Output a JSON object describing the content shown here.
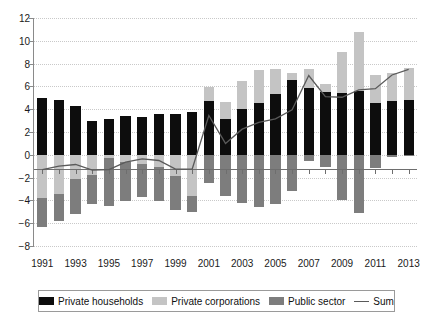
{
  "chart_data": {
    "type": "bar",
    "subtype": "stacked-bar-with-line-overlay",
    "title": "",
    "subtitle": "",
    "xlabel": "",
    "ylabel": "",
    "ylim": [
      -8,
      12
    ],
    "ytick_step": 2,
    "ytick_labels": [
      "12",
      "10",
      "8",
      "6",
      "4",
      "2",
      "0",
      "−2",
      "−4",
      "−6",
      "−8"
    ],
    "ytick_values": [
      12,
      10,
      8,
      6,
      4,
      2,
      0,
      -2,
      -4,
      -6,
      -8
    ],
    "grid": true,
    "grid_style": "dotted-horizontal",
    "legend_position": "bottom",
    "categories": [
      1991,
      1992,
      1993,
      1994,
      1995,
      1996,
      1997,
      1998,
      1999,
      2000,
      2001,
      2002,
      2003,
      2004,
      2005,
      2006,
      2007,
      2008,
      2009,
      2010,
      2011,
      2012,
      2013
    ],
    "xtick_labels": [
      "1991",
      "1993",
      "1995",
      "1997",
      "1999",
      "2001",
      "2003",
      "2005",
      "2007",
      "2009",
      "2011",
      "2013"
    ],
    "xtick_values": [
      1991,
      1993,
      1995,
      1997,
      1999,
      2001,
      2003,
      2005,
      2007,
      2009,
      2011,
      2013
    ],
    "series": [
      {
        "name": "Private households",
        "color": "#0d0d0d",
        "kind": "bar",
        "values": [
          5.0,
          4.85,
          4.3,
          3.0,
          3.15,
          3.4,
          3.35,
          3.55,
          3.55,
          3.75,
          4.75,
          3.1,
          4.0,
          4.55,
          5.3,
          6.6,
          5.9,
          5.5,
          5.45,
          5.6,
          4.55,
          4.75,
          4.85
        ]
      },
      {
        "name": "Private corporations",
        "color": "#c4c4c4",
        "kind": "bar",
        "values": [
          -3.75,
          -3.45,
          -2.1,
          -1.8,
          -0.3,
          -0.6,
          -0.8,
          -1.05,
          -1.9,
          -3.65,
          1.2,
          1.5,
          2.5,
          2.9,
          2.2,
          0.55,
          1.6,
          0.7,
          3.6,
          5.2,
          2.45,
          2.4,
          2.75
        ]
      },
      {
        "name": "Public sector",
        "color": "#7d7d7d",
        "kind": "bar",
        "values": [
          -2.55,
          -2.4,
          -3.05,
          -2.55,
          -4.15,
          -3.45,
          -2.9,
          -3.0,
          -2.9,
          -1.35,
          -2.5,
          -3.6,
          -4.25,
          -4.6,
          -4.35,
          -3.2,
          -0.55,
          -1.1,
          -4.0,
          -5.1,
          -1.2,
          -0.15,
          -0.1
        ]
      }
    ],
    "line_series": {
      "name": "Sum",
      "color": "#5a5a5a",
      "kind": "line",
      "values": [
        -1.3,
        -1.0,
        -0.85,
        -1.35,
        -1.3,
        -0.65,
        -0.35,
        -0.5,
        -1.25,
        -1.25,
        3.45,
        1.0,
        2.25,
        2.85,
        3.15,
        3.95,
        6.95,
        5.1,
        5.05,
        5.7,
        5.8,
        7.0,
        7.5
      ]
    }
  },
  "legend": {
    "items": [
      {
        "label": "Private households",
        "swatch": "black-swatch"
      },
      {
        "label": "Private corporations",
        "swatch": "light-gray-swatch"
      },
      {
        "label": "Public sector",
        "swatch": "dark-gray-swatch"
      },
      {
        "label": "Sum",
        "swatch": "line-swatch"
      }
    ]
  }
}
